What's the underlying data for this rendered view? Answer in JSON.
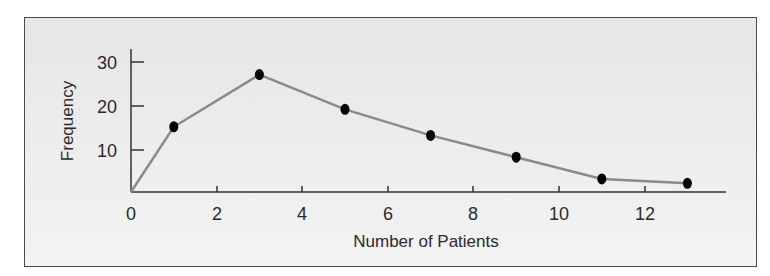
{
  "chart_data": {
    "type": "line",
    "title": "",
    "xlabel": "Number of Patients",
    "ylabel": "Frequency",
    "x": [
      0,
      1,
      3,
      5,
      7,
      9,
      11,
      13
    ],
    "series": [
      {
        "name": "Frequency polygon",
        "values": [
          0,
          15,
          27,
          19,
          13,
          8,
          3,
          2
        ],
        "color": "#8a8a8a",
        "marker_color": "#000000"
      }
    ],
    "markers_on": [
      1,
      3,
      5,
      7,
      9,
      11,
      13
    ],
    "xticks": [
      0,
      2,
      4,
      6,
      8,
      10,
      12
    ],
    "yticks": [
      10,
      20,
      30
    ],
    "xlim": [
      0,
      14
    ],
    "ylim": [
      0,
      30
    ],
    "grid": false,
    "legend": "none"
  },
  "labels": {
    "x_axis_title": "Number of Patients",
    "y_axis_title": "Frequency",
    "x_ticks": [
      "0",
      "2",
      "4",
      "6",
      "8",
      "10",
      "12"
    ],
    "y_ticks": [
      "10",
      "20",
      "30"
    ]
  }
}
